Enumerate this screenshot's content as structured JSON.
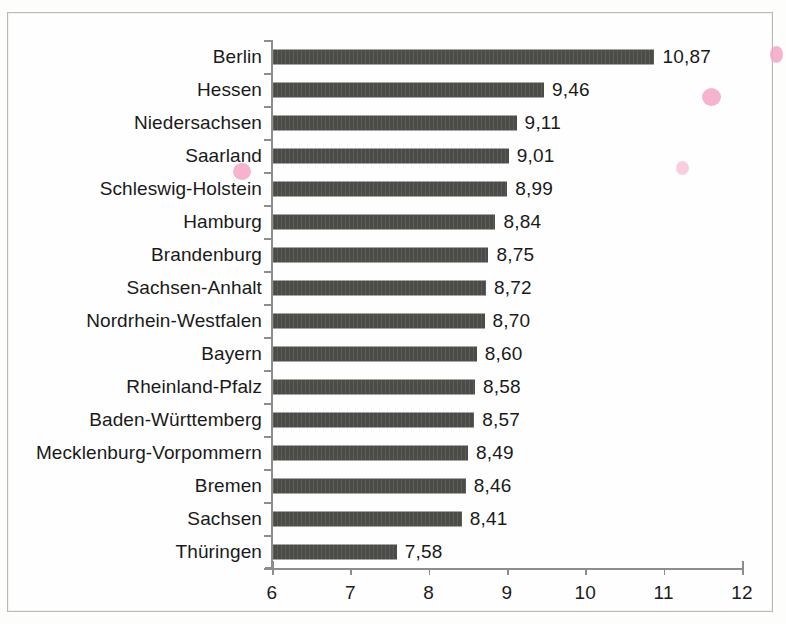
{
  "chart_data": {
    "type": "bar",
    "orientation": "horizontal",
    "title": "",
    "subtitle": "",
    "xlabel": "",
    "ylabel": "",
    "xlim": [
      6,
      12
    ],
    "xticks": [
      "6",
      "7",
      "8",
      "9",
      "10",
      "11",
      "12"
    ],
    "xtick_values": [
      6,
      7,
      8,
      9,
      10,
      11,
      12
    ],
    "grid": false,
    "legend": "none",
    "decimal_separator": ",",
    "bar_color": "#4b4b48",
    "axis_color": "#8d8d8a",
    "text_color": "#1a1a1a",
    "categories": [
      "Berlin",
      "Hessen",
      "Niedersachsen",
      "Saarland",
      "Schleswig-Holstein",
      "Hamburg",
      "Brandenburg",
      "Sachsen-Anhalt",
      "Nordrhein-Westfalen",
      "Bayern",
      "Rheinland-Pfalz",
      "Baden-Württemberg",
      "Mecklenburg-Vorpommern",
      "Bremen",
      "Sachsen",
      "Thüringen"
    ],
    "values": [
      10.87,
      9.46,
      9.11,
      9.01,
      8.99,
      8.84,
      8.75,
      8.72,
      8.7,
      8.6,
      8.58,
      8.57,
      8.49,
      8.46,
      8.41,
      7.58
    ],
    "value_labels": [
      "10,87",
      "9,46",
      "9,11",
      "9,01",
      "8,99",
      "8,84",
      "8,75",
      "8,72",
      "8,70",
      "8,60",
      "8,58",
      "8,57",
      "8,49",
      "8,46",
      "8,41",
      "7,58"
    ],
    "bars": [
      {
        "category": "Berlin",
        "value": 10.87,
        "label": "10,87"
      },
      {
        "category": "Hessen",
        "value": 9.46,
        "label": "9,46"
      },
      {
        "category": "Niedersachsen",
        "value": 9.11,
        "label": "9,11"
      },
      {
        "category": "Saarland",
        "value": 9.01,
        "label": "9,01"
      },
      {
        "category": "Schleswig-Holstein",
        "value": 8.99,
        "label": "8,99"
      },
      {
        "category": "Hamburg",
        "value": 8.84,
        "label": "8,84"
      },
      {
        "category": "Brandenburg",
        "value": 8.75,
        "label": "8,75"
      },
      {
        "category": "Sachsen-Anhalt",
        "value": 8.72,
        "label": "8,72"
      },
      {
        "category": "Nordrhein-Westfalen",
        "value": 8.7,
        "label": "8,70"
      },
      {
        "category": "Bayern",
        "value": 8.6,
        "label": "8,60"
      },
      {
        "category": "Rheinland-Pfalz",
        "value": 8.58,
        "label": "8,58"
      },
      {
        "category": "Baden-Württemberg",
        "value": 8.57,
        "label": "8,57"
      },
      {
        "category": "Mecklenburg-Vorpommern",
        "value": 8.49,
        "label": "8,49"
      },
      {
        "category": "Bremen",
        "value": 8.46,
        "label": "8,46"
      },
      {
        "category": "Sachsen",
        "value": 8.41,
        "label": "8,41"
      },
      {
        "category": "Thüringen",
        "value": 7.58,
        "label": "7,58"
      }
    ]
  },
  "artifacts": {
    "marks": [
      {
        "x": 770,
        "y": 46,
        "w": 13,
        "h": 17,
        "soft": false
      },
      {
        "x": 702,
        "y": 88,
        "w": 19,
        "h": 18,
        "soft": false
      },
      {
        "x": 676,
        "y": 161,
        "w": 13,
        "h": 14,
        "soft": true
      },
      {
        "x": 233,
        "y": 163,
        "w": 18,
        "h": 17,
        "soft": false
      }
    ]
  }
}
